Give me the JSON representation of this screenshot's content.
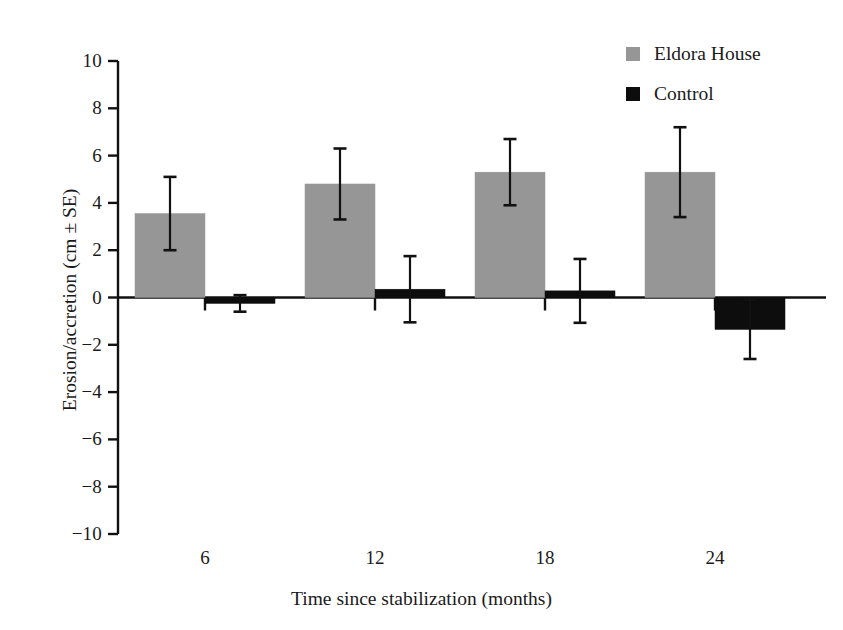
{
  "chart_data": {
    "type": "bar",
    "title": "",
    "subtitle": "",
    "xlabel": "Time since stabilization (months)",
    "ylabel": "Erosion/accretion (cm ± SE)",
    "categories": [
      "6",
      "12",
      "18",
      "24"
    ],
    "xtick_labels": [
      "6",
      "12",
      "18",
      "24"
    ],
    "ytick_labels": [
      "10",
      "8",
      "6",
      "4",
      "2",
      "0",
      "−2",
      "−4",
      "−6",
      "−8",
      "−10"
    ],
    "ytick_values": [
      10,
      8,
      6,
      4,
      2,
      0,
      -2,
      -4,
      -6,
      -8,
      -10
    ],
    "ylim": [
      -10,
      10
    ],
    "grid": false,
    "legend_position": "top-right",
    "error_bars": "SE",
    "series": [
      {
        "name": "Eldora House",
        "color": "#969696",
        "values": [
          3.55,
          4.8,
          5.3,
          5.3
        ],
        "errors": [
          1.55,
          1.5,
          1.4,
          1.9
        ]
      },
      {
        "name": "Control",
        "color": "#0d0d0d",
        "values": [
          -0.25,
          0.35,
          0.28,
          -1.35
        ],
        "errors": [
          0.35,
          1.4,
          1.35,
          1.25
        ]
      }
    ]
  },
  "legend": {
    "items": [
      {
        "label": "Eldora House",
        "color": "#969696"
      },
      {
        "label": "Control",
        "color": "#0d0d0d"
      }
    ]
  },
  "axes": {
    "y_title": "Erosion/accretion (cm ± SE)",
    "x_title": "Time since stabilization (months)"
  }
}
